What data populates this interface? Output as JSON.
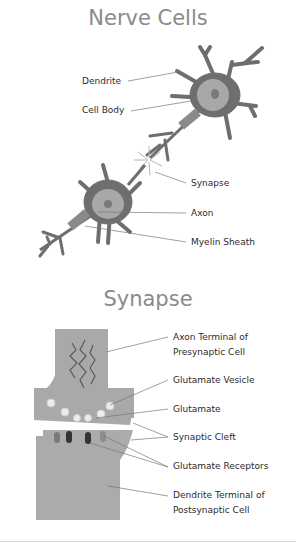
{
  "nerve_cells": {
    "title": "Nerve Cells",
    "labels": {
      "dendrite": "Dendrite",
      "cell_body": "Cell Body",
      "synapse": "Synapse",
      "axon": "Axon",
      "myelin_sheath": "Myelin Sheath"
    }
  },
  "synapse": {
    "title": "Synapse",
    "labels": {
      "axon_terminal_1": "Axon Terminal of",
      "axon_terminal_2": "Presynaptic Cell",
      "glutamate_vesicle": "Glutamate Vesicle",
      "glutamate": "Glutamate",
      "synaptic_cleft": "Synaptic Cleft",
      "glutamate_receptors": "Glutamate Receptors",
      "dendrite_terminal_1": "Dendrite Terminal of",
      "dendrite_terminal_2": "Postsynaptic Cell"
    }
  },
  "colors": {
    "title": "#8a8a8a",
    "neuron_dark": "#6e6e6e",
    "neuron_body": "#a8a8a8",
    "synapse_fill": "#a9a9a9",
    "receptor_dark": "#333333"
  }
}
